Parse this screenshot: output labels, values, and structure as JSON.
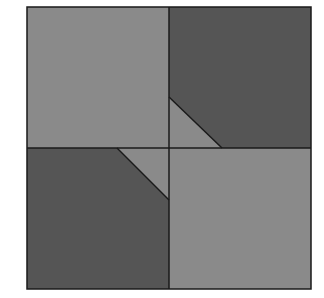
{
  "figure": {
    "outer_square": {
      "x": 27,
      "y": 7,
      "width": 284,
      "height": 282
    },
    "center": {
      "x": 169,
      "y": 148
    },
    "colors": {
      "light_gray": "#8a8a8a",
      "dark_gray": "#555555",
      "line": "#1a1a1a",
      "background": "#ffffff"
    },
    "quadrants": [
      {
        "name": "top-left",
        "shade": "light"
      },
      {
        "name": "top-right",
        "shade": "dark"
      },
      {
        "name": "bottom-left",
        "shade": "dark"
      },
      {
        "name": "bottom-right",
        "shade": "light"
      }
    ],
    "triangles": [
      {
        "name": "top-right-cut",
        "points": [
          [
            169,
            97
          ],
          [
            222,
            148
          ],
          [
            169,
            148
          ]
        ],
        "shade": "light"
      },
      {
        "name": "bottom-left-cut",
        "points": [
          [
            117,
            148
          ],
          [
            169,
            148
          ],
          [
            169,
            200
          ]
        ],
        "shade": "light"
      }
    ]
  }
}
